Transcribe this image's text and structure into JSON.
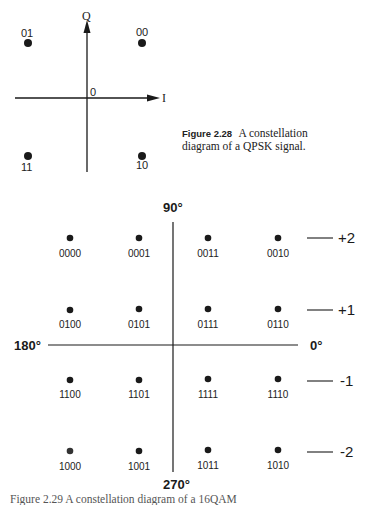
{
  "qpsk": {
    "axis_q_label": "Q",
    "axis_i_label": "I",
    "origin_label": "0",
    "points": [
      {
        "bits": "01",
        "i": -1,
        "q": 1
      },
      {
        "bits": "00",
        "i": 1,
        "q": 1
      },
      {
        "bits": "11",
        "i": -1,
        "q": -1
      },
      {
        "bits": "10",
        "i": 1,
        "q": -1
      }
    ],
    "caption": {
      "figure_label": "Figure 2.28",
      "text_line1": "A constellation",
      "text_line2": "diagram of a QPSK signal."
    }
  },
  "qam16": {
    "angle_labels": {
      "top": "90°",
      "left": "180°",
      "right": "0°",
      "bottom": "270°"
    },
    "level_labels": [
      "+2",
      "+1",
      "-1",
      "-2"
    ],
    "rows": [
      [
        "0000",
        "0001",
        "0011",
        "0010"
      ],
      [
        "0100",
        "0101",
        "0111",
        "0110"
      ],
      [
        "1100",
        "1101",
        "1111",
        "1110"
      ],
      [
        "1000",
        "1001",
        "1011",
        "1010"
      ]
    ],
    "bottom_caption_partial": "Figure 2.29  A constellation diagram of a 16QAM"
  }
}
